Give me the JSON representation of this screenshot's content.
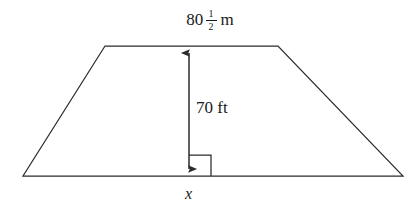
{
  "figure": {
    "kind": "geometry-diagram",
    "shape": "trapezoid",
    "background_color": "#ffffff",
    "stroke_color": "#2b2b2b",
    "text_color": "#1a1a1a",
    "stroke_width": 1.2
  },
  "labels": {
    "top_base": {
      "whole": "80",
      "numerator": "1",
      "denominator": "2",
      "unit": "m",
      "full_text": "80 1/2 m"
    },
    "height": {
      "value": "70",
      "unit": "ft",
      "full_text": "70 ft"
    },
    "base_variable": {
      "text": "x"
    }
  },
  "geometry": {
    "trapezoid_points": "23,176 105,46 278,46 403,176",
    "top_base": {
      "x1": 105,
      "y1": 46,
      "x2": 278,
      "y2": 46
    },
    "bottom_base": {
      "x1": 23,
      "y1": 176,
      "x2": 403,
      "y2": 176
    },
    "left_leg": {
      "x1": 23,
      "y1": 176,
      "x2": 105,
      "y2": 46
    },
    "right_leg": {
      "x1": 278,
      "y1": 46,
      "x2": 403,
      "y2": 176
    },
    "height_arrow": {
      "x": 189,
      "y_top": 46,
      "y_bottom": 176
    },
    "right_angle_marker": {
      "x": 189,
      "y": 155,
      "size": 22
    }
  }
}
